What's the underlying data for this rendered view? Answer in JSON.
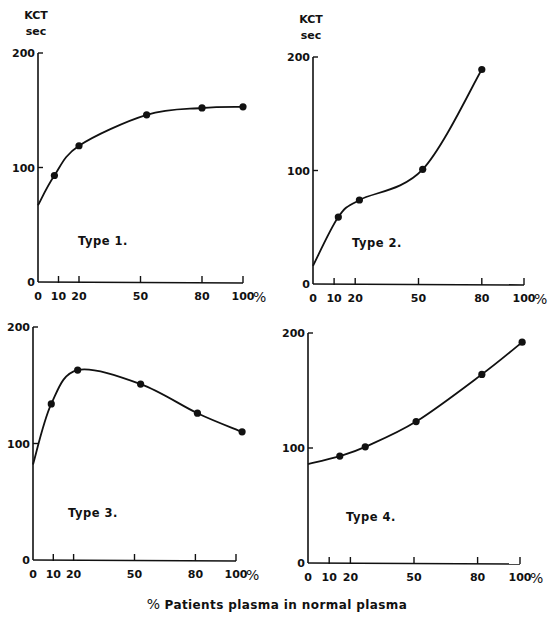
{
  "figure": {
    "y_unit_label_line1": "KCT",
    "y_unit_label_line2": "sec",
    "caption_symbol": "%",
    "caption_text": "Patients plasma in normal plasma",
    "x_ticks": [
      "0",
      "10",
      "20",
      "50",
      "80",
      "100"
    ],
    "x_tick_values": [
      0,
      10,
      20,
      50,
      80,
      100
    ],
    "x_suffix": "%",
    "y_ticks": [
      "0",
      "100",
      "200"
    ],
    "line_color": "#111111"
  },
  "chart_data": [
    {
      "type": "line",
      "title": "Type 1.",
      "xlabel": "% Patients plasma in normal plasma",
      "ylabel": "KCT sec",
      "xlim": [
        0,
        100
      ],
      "ylim": [
        0,
        200
      ],
      "x_ticks": [
        0,
        10,
        20,
        50,
        80,
        100
      ],
      "y_ticks": [
        0,
        100,
        200
      ],
      "curve_start": [
        0,
        67
      ],
      "series": [
        {
          "name": "Type 1",
          "x": [
            8,
            20,
            53,
            80,
            100
          ],
          "y": [
            93,
            119,
            146,
            152,
            153
          ]
        }
      ],
      "grid": false,
      "legend": "none"
    },
    {
      "type": "line",
      "title": "Type 2.",
      "xlabel": "% Patients plasma in normal plasma",
      "ylabel": "KCT sec",
      "xlim": [
        0,
        100
      ],
      "ylim": [
        0,
        200
      ],
      "x_ticks": [
        0,
        10,
        20,
        50,
        80,
        100
      ],
      "y_ticks": [
        0,
        100,
        200
      ],
      "curve_start": [
        0,
        16
      ],
      "series": [
        {
          "name": "Type 2",
          "x": [
            12,
            22,
            52,
            80
          ],
          "y": [
            59,
            74,
            101,
            189
          ]
        }
      ],
      "grid": false,
      "legend": "none"
    },
    {
      "type": "line",
      "title": "Type 3.",
      "xlabel": "% Patients plasma in normal plasma",
      "ylabel": "KCT sec",
      "xlim": [
        0,
        100
      ],
      "ylim": [
        0,
        200
      ],
      "x_ticks": [
        0,
        10,
        20,
        50,
        80,
        100
      ],
      "y_ticks": [
        0,
        100,
        200
      ],
      "curve_start": [
        0,
        82
      ],
      "series": [
        {
          "name": "Type 3",
          "x": [
            9,
            22,
            53,
            81,
            103
          ],
          "y": [
            134,
            163,
            151,
            126,
            110
          ]
        }
      ],
      "grid": false,
      "legend": "none"
    },
    {
      "type": "line",
      "title": "Type 4.",
      "xlabel": "% Patients plasma in normal plasma",
      "ylabel": "KCT sec",
      "xlim": [
        0,
        100
      ],
      "ylim": [
        0,
        200
      ],
      "x_ticks": [
        0,
        10,
        20,
        50,
        80,
        100
      ],
      "y_ticks": [
        0,
        100,
        200
      ],
      "curve_start": [
        0,
        86
      ],
      "series": [
        {
          "name": "Type 4",
          "x": [
            15,
            27,
            51,
            82,
            101
          ],
          "y": [
            93,
            101,
            123,
            164,
            192
          ]
        }
      ],
      "grid": false,
      "legend": "none"
    }
  ],
  "panels": [
    {
      "name": "type-1",
      "label": "Type 1.",
      "show_unit": true,
      "ox": 38,
      "oy": 282,
      "x100": 243,
      "y200": 53,
      "label_pos": [
        78,
        245
      ],
      "curve": "M38,205 C45,185 52,172 62,165 C75,155 88,146 102,140 C130,128 150,118 185,112 C210,108 225,108 250,108"
    },
    {
      "name": "type-2",
      "label": "Type 2.",
      "show_unit": true,
      "ox": 313,
      "oy": 284,
      "x100": 524,
      "y200": 57,
      "label_pos": [
        352,
        247
      ],
      "curve": "M313,266 C318,240 325,225 340,217 C355,208 360,205 370,200 C390,190 405,183 424,170 C455,150 478,115 482,70"
    },
    {
      "name": "type-3",
      "label": "Type 3.",
      "show_unit": false,
      "ox": 33,
      "oy": 560,
      "x100": 236,
      "y200": 327,
      "label_pos": [
        68,
        517
      ],
      "curve": "M33,464 C38,430 45,415 52,405 C60,390 68,377 80,372 C95,368 115,370 140,384 C165,396 190,406 205,414 C220,421 232,428 241,433"
    },
    {
      "name": "type-4",
      "label": "Type 4.",
      "show_unit": false,
      "ox": 308,
      "oy": 563,
      "x100": 520,
      "y200": 333,
      "label_pos": [
        346,
        521
      ],
      "curve": "M308,463 C325,460 335,457 342,455 C360,451 370,447 380,443 C400,436 410,430 417,424 C450,406 470,393 482,385 C500,370 512,358 521,342"
    }
  ]
}
